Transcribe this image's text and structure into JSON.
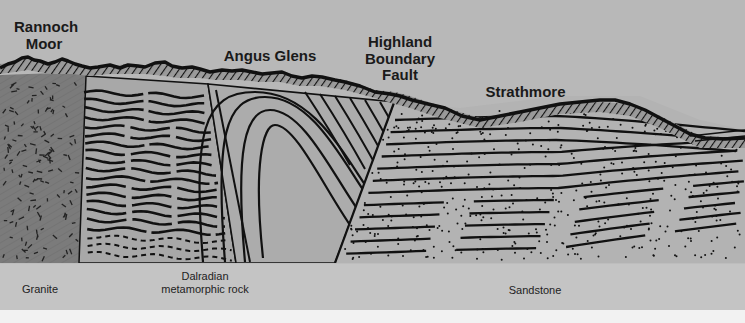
{
  "diagram": {
    "regions": [
      {
        "name": "Rannoch Moor"
      },
      {
        "name": "Angus Glens"
      },
      {
        "name": "Highland Boundary Fault"
      },
      {
        "name": "Strathmore"
      }
    ],
    "top_labels": {
      "rannoch": "Rannoch\nMoor",
      "rannoch_line1": "Rannoch",
      "rannoch_line2": "Moor",
      "angus": "Angus Glens",
      "fault_line1": "Highland",
      "fault_line2": "Boundary",
      "fault_line3": "Fault",
      "strathmore": "Strathmore"
    },
    "rock_labels": {
      "granite": "Granite",
      "dalradian_line1": "Dalradian",
      "dalradian_line2": "metamorphic rock",
      "sandstone": "Sandstone"
    },
    "colors": {
      "sky": "#b8b8b8",
      "granite": "#7d7d7d",
      "dalradian": "#a9a9a9",
      "fold_block": "#adadad",
      "sandstone": "#b3b3b3",
      "ink": "#111111",
      "legend_band": "#c4c4c4"
    }
  }
}
